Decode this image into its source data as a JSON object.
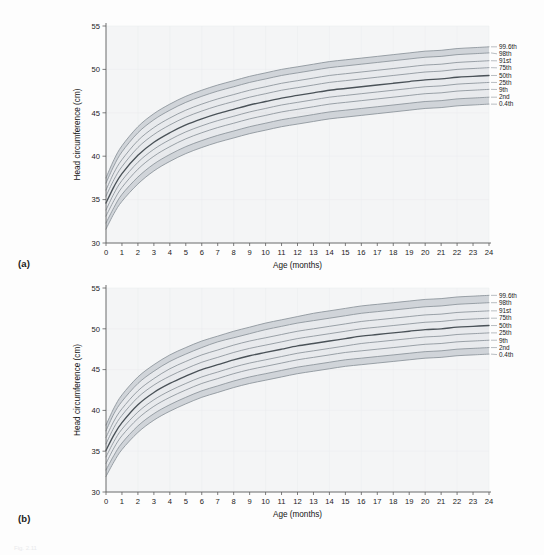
{
  "figure": {
    "panel_a_label": "(a)",
    "panel_b_label": "(b)",
    "footer_note": "Fig. 2.11"
  },
  "ghost": {
    "a": "Normal development",
    "b": "Normal development"
  },
  "colors": {
    "band_fill": "#b9c0c7",
    "band_fill_light": "#ccd2d8",
    "curve": "#8a9299",
    "curve_median": "#4a5258",
    "axis": "#5d5d5d",
    "plot_bg": "#f4f5f6",
    "text": "#1b1b1b"
  },
  "chart_data": [
    {
      "type": "line",
      "id": "chart-a",
      "title": "",
      "subtitle": "",
      "xlabel": "Age (months)",
      "ylabel": "Head circumference (cm)",
      "xlim": [
        0,
        24
      ],
      "ylim": [
        30,
        55
      ],
      "xticks": [
        0,
        1,
        2,
        3,
        4,
        5,
        6,
        7,
        8,
        9,
        10,
        11,
        12,
        13,
        14,
        15,
        16,
        17,
        18,
        19,
        20,
        21,
        22,
        23,
        24
      ],
      "xtick_labels": [
        "0",
        "1",
        "2",
        "3",
        "4",
        "5",
        "6",
        "7",
        "8",
        "9",
        "10",
        "11",
        "12",
        "13",
        "14",
        "15",
        "16",
        "17",
        "18",
        "19",
        "20",
        "21",
        "22",
        "23",
        "24"
      ],
      "yticks": [
        30,
        35,
        40,
        45,
        50,
        55
      ],
      "ytick_labels": [
        "30",
        "35",
        "40",
        "45",
        "50",
        "55"
      ],
      "grid": false,
      "legend_position": "right",
      "x": [
        0,
        0.5,
        1,
        2,
        3,
        4,
        5,
        6,
        7,
        8,
        9,
        10,
        11,
        12,
        13,
        14,
        15,
        16,
        17,
        18,
        19,
        20,
        21,
        22,
        23,
        24
      ],
      "series": [
        {
          "name": "99.6th",
          "values": [
            37.5,
            39.6,
            41.2,
            43.4,
            44.9,
            46.0,
            46.9,
            47.6,
            48.2,
            48.7,
            49.2,
            49.6,
            50.0,
            50.3,
            50.6,
            50.9,
            51.1,
            51.3,
            51.5,
            51.7,
            51.9,
            52.1,
            52.2,
            52.4,
            52.5,
            52.6
          ]
        },
        {
          "name": "98th",
          "values": [
            36.9,
            38.9,
            40.5,
            42.7,
            44.2,
            45.3,
            46.2,
            46.9,
            47.5,
            48.0,
            48.5,
            48.9,
            49.3,
            49.6,
            49.9,
            50.2,
            50.4,
            50.6,
            50.8,
            51.0,
            51.2,
            51.4,
            51.5,
            51.7,
            51.8,
            51.9
          ]
        },
        {
          "name": "91st",
          "values": [
            36.1,
            38.1,
            39.6,
            41.8,
            43.3,
            44.4,
            45.3,
            46.0,
            46.6,
            47.1,
            47.6,
            48.0,
            48.4,
            48.7,
            49.0,
            49.3,
            49.5,
            49.7,
            49.9,
            50.1,
            50.3,
            50.5,
            50.6,
            50.8,
            50.9,
            51.0
          ]
        },
        {
          "name": "75th",
          "values": [
            35.4,
            37.3,
            38.8,
            41.0,
            42.5,
            43.6,
            44.5,
            45.2,
            45.8,
            46.3,
            46.8,
            47.2,
            47.6,
            47.9,
            48.2,
            48.5,
            48.7,
            48.9,
            49.1,
            49.3,
            49.5,
            49.7,
            49.8,
            50.0,
            50.1,
            50.2
          ]
        },
        {
          "name": "50th",
          "values": [
            34.6,
            36.5,
            38.0,
            40.1,
            41.6,
            42.7,
            43.6,
            44.3,
            44.9,
            45.4,
            45.9,
            46.3,
            46.7,
            47.0,
            47.3,
            47.6,
            47.8,
            48.0,
            48.2,
            48.4,
            48.6,
            48.8,
            48.9,
            49.1,
            49.2,
            49.3
          ]
        },
        {
          "name": "25th",
          "values": [
            33.8,
            35.7,
            37.2,
            39.3,
            40.8,
            41.9,
            42.8,
            43.5,
            44.1,
            44.6,
            45.1,
            45.5,
            45.9,
            46.2,
            46.5,
            46.8,
            47.0,
            47.2,
            47.4,
            47.6,
            47.8,
            48.0,
            48.1,
            48.3,
            48.4,
            48.5
          ]
        },
        {
          "name": "9th",
          "values": [
            33.1,
            34.9,
            36.4,
            38.5,
            40.0,
            41.1,
            42.0,
            42.7,
            43.3,
            43.8,
            44.3,
            44.7,
            45.1,
            45.4,
            45.7,
            46.0,
            46.2,
            46.4,
            46.6,
            46.8,
            47.0,
            47.2,
            47.3,
            47.5,
            47.6,
            47.7
          ]
        },
        {
          "name": "2nd",
          "values": [
            32.3,
            34.1,
            35.6,
            37.6,
            39.1,
            40.2,
            41.1,
            41.8,
            42.4,
            42.9,
            43.4,
            43.8,
            44.2,
            44.5,
            44.8,
            45.1,
            45.3,
            45.5,
            45.7,
            45.9,
            46.1,
            46.3,
            46.4,
            46.6,
            46.7,
            46.8
          ]
        },
        {
          "name": "0.4th",
          "values": [
            31.6,
            33.4,
            34.8,
            36.8,
            38.3,
            39.4,
            40.3,
            41.0,
            41.6,
            42.1,
            42.6,
            43.0,
            43.4,
            43.7,
            44.0,
            44.3,
            44.5,
            44.7,
            44.9,
            45.1,
            45.3,
            45.5,
            45.6,
            45.8,
            45.9,
            46.0
          ]
        }
      ]
    },
    {
      "type": "line",
      "id": "chart-b",
      "title": "",
      "subtitle": "",
      "xlabel": "Age (months)",
      "ylabel": "Head circumference (cm)",
      "xlim": [
        0,
        24
      ],
      "ylim": [
        30,
        55
      ],
      "xticks": [
        0,
        1,
        2,
        3,
        4,
        5,
        6,
        7,
        8,
        9,
        10,
        11,
        12,
        13,
        14,
        15,
        16,
        17,
        18,
        19,
        20,
        21,
        22,
        23,
        24
      ],
      "xtick_labels": [
        "0",
        "1",
        "2",
        "3",
        "4",
        "5",
        "6",
        "7",
        "8",
        "9",
        "10",
        "11",
        "12",
        "13",
        "14",
        "15",
        "16",
        "17",
        "18",
        "19",
        "20",
        "21",
        "22",
        "23",
        "24"
      ],
      "yticks": [
        30,
        35,
        40,
        45,
        50,
        55
      ],
      "ytick_labels": [
        "30",
        "35",
        "40",
        "45",
        "50",
        "55"
      ],
      "grid": false,
      "legend_position": "right",
      "x": [
        0,
        0.5,
        1,
        2,
        3,
        4,
        5,
        6,
        7,
        8,
        9,
        10,
        11,
        12,
        13,
        14,
        15,
        16,
        17,
        18,
        19,
        20,
        21,
        22,
        23,
        24
      ],
      "series": [
        {
          "name": "99.6th",
          "values": [
            38.2,
            40.3,
            41.9,
            44.1,
            45.6,
            46.8,
            47.7,
            48.5,
            49.1,
            49.7,
            50.2,
            50.7,
            51.1,
            51.5,
            51.9,
            52.2,
            52.5,
            52.8,
            53.0,
            53.2,
            53.4,
            53.6,
            53.7,
            53.9,
            54.0,
            54.1
          ]
        },
        {
          "name": "98th",
          "values": [
            37.5,
            39.6,
            41.1,
            43.3,
            44.8,
            46.0,
            46.9,
            47.7,
            48.4,
            48.9,
            49.4,
            49.9,
            50.3,
            50.7,
            51.0,
            51.3,
            51.6,
            51.9,
            52.1,
            52.3,
            52.5,
            52.7,
            52.8,
            53.0,
            53.1,
            53.2
          ]
        },
        {
          "name": "91st",
          "values": [
            36.7,
            38.7,
            40.2,
            42.4,
            43.9,
            45.1,
            46.0,
            46.8,
            47.4,
            48.0,
            48.5,
            48.9,
            49.3,
            49.7,
            50.0,
            50.3,
            50.6,
            50.9,
            51.1,
            51.3,
            51.5,
            51.7,
            51.8,
            52.0,
            52.1,
            52.2
          ]
        },
        {
          "name": "75th",
          "values": [
            35.9,
            37.9,
            39.4,
            41.6,
            43.1,
            44.2,
            45.1,
            45.9,
            46.5,
            47.1,
            47.6,
            48.0,
            48.4,
            48.8,
            49.1,
            49.4,
            49.7,
            50.0,
            50.2,
            50.4,
            50.6,
            50.8,
            50.9,
            51.1,
            51.2,
            51.3
          ]
        },
        {
          "name": "50th",
          "values": [
            35.1,
            37.0,
            38.5,
            40.7,
            42.2,
            43.3,
            44.2,
            45.0,
            45.6,
            46.2,
            46.7,
            47.1,
            47.5,
            47.9,
            48.2,
            48.5,
            48.8,
            49.1,
            49.3,
            49.5,
            49.7,
            49.9,
            50.0,
            50.2,
            50.3,
            50.4
          ]
        },
        {
          "name": "25th",
          "values": [
            34.3,
            36.2,
            37.7,
            39.8,
            41.3,
            42.4,
            43.3,
            44.1,
            44.7,
            45.3,
            45.8,
            46.2,
            46.6,
            47.0,
            47.3,
            47.6,
            47.9,
            48.2,
            48.4,
            48.6,
            48.8,
            49.0,
            49.1,
            49.3,
            49.4,
            49.5
          ]
        },
        {
          "name": "9th",
          "values": [
            33.5,
            35.4,
            36.9,
            39.0,
            40.5,
            41.6,
            42.5,
            43.3,
            43.9,
            44.5,
            45.0,
            45.4,
            45.8,
            46.2,
            46.5,
            46.8,
            47.1,
            47.3,
            47.5,
            47.7,
            47.9,
            48.1,
            48.2,
            48.4,
            48.5,
            48.6
          ]
        },
        {
          "name": "2nd",
          "values": [
            32.7,
            34.5,
            36.0,
            38.1,
            39.6,
            40.7,
            41.6,
            42.4,
            43.0,
            43.6,
            44.1,
            44.5,
            44.9,
            45.3,
            45.6,
            45.9,
            46.2,
            46.4,
            46.6,
            46.8,
            47.0,
            47.2,
            47.3,
            47.5,
            47.6,
            47.7
          ]
        },
        {
          "name": "0.4th",
          "values": [
            31.9,
            33.7,
            35.2,
            37.3,
            38.8,
            39.9,
            40.8,
            41.6,
            42.2,
            42.8,
            43.3,
            43.7,
            44.1,
            44.5,
            44.8,
            45.1,
            45.4,
            45.6,
            45.8,
            46.0,
            46.2,
            46.4,
            46.5,
            46.7,
            46.8,
            46.9
          ]
        }
      ]
    }
  ]
}
